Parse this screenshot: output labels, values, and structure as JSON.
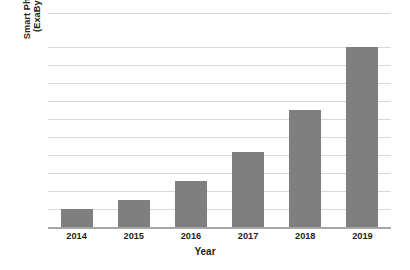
{
  "chart_data": {
    "type": "bar",
    "title": "",
    "subtitle": "",
    "xlabel": "Year",
    "ylabel": "Smart Phone Data Traffic (ExaByte per Second)",
    "ylabel_lines": [
      "Smart Phone Data Traffic",
      "(ExaByte per Second)"
    ],
    "categories": [
      "2014",
      "2015",
      "2016",
      "2017",
      "2018",
      "2019"
    ],
    "values": [
      1.0,
      1.5,
      2.55,
      4.15,
      6.5,
      10.0
    ],
    "series": [
      {
        "name": "Smart Phone Data Traffic",
        "values": [
          1.0,
          1.5,
          2.55,
          4.15,
          6.5,
          10.0
        ]
      }
    ],
    "ylim": [
      0,
      11.9
    ],
    "xlim_categories": 6,
    "y_tick_values": [
      1,
      2,
      3,
      4,
      5,
      6,
      7,
      8,
      9,
      10,
      11.9
    ],
    "y_tick_labels_visible": false,
    "grid": true,
    "grid_axis": "y",
    "legend": false,
    "legend_position": "none",
    "bar_color": "#7f7f7f",
    "gridline_color": "#d9d9d9",
    "axis_color": "#a6a6a6",
    "background_color": "#ffffff",
    "text_color": "#231f20"
  },
  "axes": {
    "y_title_line1": "Smart Phone Data Traffic",
    "y_title_line2": "(ExaByte per Second)",
    "x_title": "Year"
  },
  "ticks": {
    "x": [
      "2014",
      "2015",
      "2016",
      "2017",
      "2018",
      "2019"
    ]
  }
}
